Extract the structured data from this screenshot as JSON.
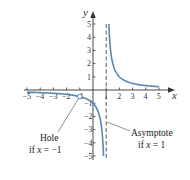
{
  "chart_data": {
    "type": "line",
    "title": "",
    "function": "f(x) = 1/(x - 1), x ≠ -1",
    "xlabel": "x",
    "ylabel": "y",
    "xlim": [
      -5,
      5
    ],
    "ylim": [
      -5,
      5
    ],
    "grid": false,
    "x_ticks": [
      "-5",
      "-4",
      "-3",
      "-2",
      "-1",
      "1",
      "2",
      "3",
      "4",
      "5"
    ],
    "y_ticks": [
      "5",
      "4",
      "3",
      "2",
      "1",
      "-1",
      "-2",
      "-3",
      "-4",
      "-5"
    ],
    "series": [
      {
        "name": "left branch",
        "x": [
          -5,
          -4,
          -3,
          -2,
          -1,
          0,
          0.5,
          0.8
        ],
        "y": [
          -0.167,
          -0.2,
          -0.25,
          -0.333,
          -0.5,
          -1,
          -2,
          -5
        ]
      },
      {
        "name": "right branch",
        "x": [
          1.2,
          1.5,
          2,
          3,
          4,
          5
        ],
        "y": [
          5,
          2,
          1,
          0.5,
          0.333,
          0.25
        ]
      }
    ],
    "hole": {
      "x": -1,
      "y": -0.5
    },
    "asymptote": {
      "x": 1,
      "style": "dashed"
    },
    "annotations": [
      {
        "text_line1": "Hole",
        "text_line2_prefix": "if ",
        "text_line2_var": "x",
        "text_line2_suffix": " = −1"
      },
      {
        "text_line1": "Asymptote",
        "text_line2_prefix": "if ",
        "text_line2_var": "x",
        "text_line2_suffix": " = 1"
      }
    ],
    "curve_color": "#5b86b0",
    "axis_color": "#333333"
  }
}
